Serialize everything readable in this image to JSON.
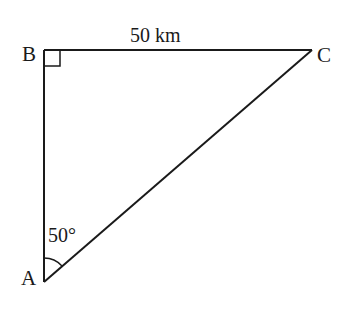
{
  "diagram": {
    "type": "right-triangle",
    "vertices": {
      "A": {
        "label": "A",
        "x": 44,
        "y": 282
      },
      "B": {
        "label": "B",
        "x": 44,
        "y": 50
      },
      "C": {
        "label": "C",
        "x": 312,
        "y": 50
      }
    },
    "side_BC_label": "50 km",
    "angle_A_label": "50°",
    "right_angle_at": "B",
    "colors": {
      "stroke": "#1a1a1a",
      "background": "#ffffff"
    }
  }
}
